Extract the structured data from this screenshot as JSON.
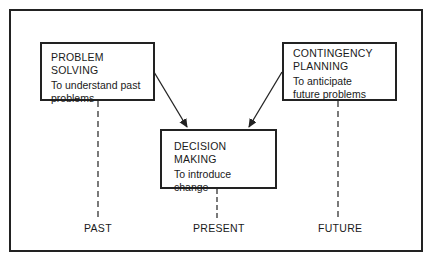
{
  "diagram": {
    "nodes": [
      {
        "id": "problem-solving",
        "title": "PROBLEM SOLVING",
        "description": "To understand past problems"
      },
      {
        "id": "contingency-planning",
        "title": "CONTINGENCY PLANNING",
        "description": "To anticipate future problems"
      },
      {
        "id": "decision-making",
        "title": "DECISION MAKING",
        "description": "To introduce change"
      }
    ],
    "edges": [
      {
        "from": "problem-solving",
        "to": "decision-making",
        "style": "arrow"
      },
      {
        "from": "contingency-planning",
        "to": "decision-making",
        "style": "arrow"
      }
    ],
    "timeline": [
      "PAST",
      "PRESENT",
      "FUTURE"
    ],
    "colors": {
      "line": "#222222",
      "background": "#ffffff"
    }
  },
  "ps": {
    "title": "PROBLEM SOLVING",
    "desc1": "To understand past",
    "desc2": "problems"
  },
  "cp": {
    "title1": "CONTINGENCY",
    "title2": "PLANNING",
    "desc1": "To anticipate",
    "desc2": "future problems"
  },
  "dm": {
    "title": "DECISION MAKING",
    "desc1": "To introduce change"
  },
  "time": {
    "past": "PAST",
    "present": "PRESENT",
    "future": "FUTURE"
  }
}
